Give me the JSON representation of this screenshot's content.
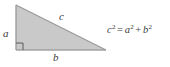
{
  "figure": {
    "kind": "pythagorean-theorem-diagram",
    "background_color": "#ffffff",
    "triangle": {
      "fill_color": "#c9c9c9",
      "stroke_color": "#9a9a9a",
      "vertices": [
        {
          "name": "top-left",
          "x": 16,
          "y": 5
        },
        {
          "name": "bottom-right",
          "x": 106,
          "y": 50
        },
        {
          "name": "bottom-left",
          "x": 16,
          "y": 50
        }
      ],
      "right_angle_marker": {
        "at_vertex": "bottom-left",
        "size": 7,
        "stroke_color": "#5a5a5a"
      }
    },
    "labels": {
      "leg_a": "a",
      "leg_b": "b",
      "hypotenuse_c": "c",
      "text_color": "#3b3b3b"
    },
    "equation": {
      "full_text": "c² = a² + b²",
      "lhs_var": "c",
      "lhs_exp": "2",
      "equals": "=",
      "term1_var": "a",
      "term1_exp": "2",
      "plus": "+",
      "term2_var": "b",
      "term2_exp": "2"
    }
  }
}
